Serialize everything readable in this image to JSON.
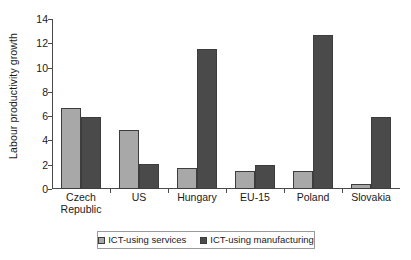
{
  "chart_data": {
    "type": "bar",
    "title": "",
    "xlabel": "",
    "ylabel": "Labour productivity growth",
    "ylim": [
      0,
      14
    ],
    "ytick_step": 2,
    "yticks": [
      0,
      2,
      4,
      6,
      8,
      10,
      12,
      14
    ],
    "ytick_labels": [
      "0",
      "2",
      "4",
      "6",
      "8",
      "10",
      "12",
      "14"
    ],
    "grid": false,
    "legend_position": "bottom",
    "categories": [
      "Czech Republic",
      "US",
      "Hungary",
      "EU-15",
      "Poland",
      "Slovakia"
    ],
    "category_lines": [
      [
        "Czech",
        "Republic"
      ],
      [
        "US"
      ],
      [
        "Hungary"
      ],
      [
        "EU-15"
      ],
      [
        "Poland"
      ],
      [
        "Slovakia"
      ]
    ],
    "series": [
      {
        "name": "ICT-using services",
        "color": "#a8a8a8",
        "values": [
          6.7,
          4.85,
          1.75,
          1.45,
          1.45,
          0.4
        ]
      },
      {
        "name": "ICT-using manufacturing",
        "color": "#4a4a4a",
        "values": [
          5.95,
          2.1,
          11.55,
          1.97,
          12.7,
          5.9
        ]
      }
    ]
  },
  "legend": {
    "entries": [
      {
        "label": "ICT-using services",
        "color": "#a8a8a8"
      },
      {
        "label": "ICT-using manufacturing",
        "color": "#4a4a4a"
      }
    ]
  },
  "axis": {
    "line_color": "#4a4a4a"
  }
}
